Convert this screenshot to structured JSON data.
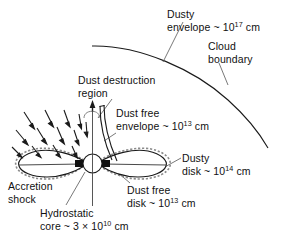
{
  "figure": {
    "background_color": "#ffffff",
    "ink_color": "#1a1a1a"
  },
  "labels": {
    "dusty_envelope": {
      "line1": "Dusty",
      "line2_pre": "envelope ~ 10",
      "line2_exp": "17",
      "line2_post": " cm"
    },
    "cloud_boundary": {
      "line1": "Cloud",
      "line2": "boundary"
    },
    "dust_destruction": {
      "line1": "Dust destruction",
      "line2": "region"
    },
    "dust_free_envelope": {
      "line1": "Dust free",
      "line2_pre": "envelope ~ 10",
      "line2_exp": "13",
      "line2_post": " cm"
    },
    "dusty_disk": {
      "line1": "Dusty",
      "line2_pre": "disk ~ 10",
      "line2_exp": "14",
      "line2_post": " cm"
    },
    "accretion_shock": {
      "line1": "Accretion",
      "line2": "shock"
    },
    "dust_free_disk": {
      "line1": "Dust free",
      "line2_pre": "disk ~ 10",
      "line2_exp": "13",
      "line2_post": " cm"
    },
    "hydrostatic_core": {
      "line1": "Hydrostatic",
      "line2_pre": "core ~ 3 × 10",
      "line2_exp": "10",
      "line2_post": " cm"
    }
  },
  "graphics": {
    "cloud_boundary_arc": "arc sweeping from upper-left to lower-right",
    "rotation_axis": "vertical line through the core with upward arrow",
    "infall_arrows_count": 13,
    "disk_lobes": 2,
    "core_shape": "circle",
    "dust_free_disk_blocks": 2,
    "outflow_cavity_walls": 2
  }
}
